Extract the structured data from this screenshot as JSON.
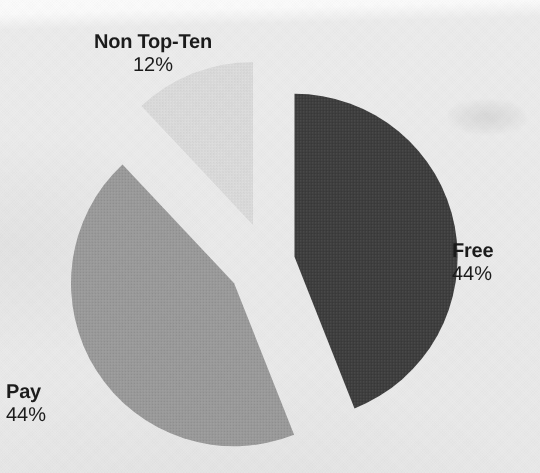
{
  "figure": {
    "kind": "pie-chart",
    "background_color": "#eaeaea",
    "medium": "scanned-print"
  },
  "chart_data": {
    "type": "pie",
    "title": "",
    "subtitle": "",
    "xlabel": "",
    "ylabel": "",
    "legend_position": "none",
    "grid": false,
    "exploded": true,
    "labels_show_percent": true,
    "total_percent": 100,
    "categories": [
      "Free",
      "Pay",
      "Non Top-Ten"
    ],
    "values": [
      44,
      44,
      12
    ],
    "value_labels": [
      "44%",
      "44%",
      "12%"
    ],
    "colors": [
      "#3d3d3d",
      "#9a9a9a",
      "#dcdcdc"
    ],
    "slices": [
      {
        "name": "Free",
        "value": 44,
        "value_label": "44%",
        "color": "#3d3d3d",
        "start_angle_deg": 0,
        "end_angle_deg": 158.4,
        "explode_direction_deg": 79,
        "label_position": "right"
      },
      {
        "name": "Pay",
        "value": 44,
        "value_label": "44%",
        "color": "#9a9a9a",
        "start_angle_deg": 158.4,
        "end_angle_deg": 316.8,
        "explode_direction_deg": 238,
        "label_position": "bottom-left"
      },
      {
        "name": "Non Top-Ten",
        "value": 12,
        "value_label": "12%",
        "color": "#dcdcdc",
        "start_angle_deg": 316.8,
        "end_angle_deg": 360,
        "explode_direction_deg": 338,
        "label_position": "top-left"
      }
    ]
  },
  "labels": {
    "non_top_ten": {
      "name": "Non Top-Ten",
      "percent": "12%"
    },
    "free": {
      "name": "Free",
      "percent": "44%"
    },
    "pay": {
      "name": "Pay",
      "percent": "44%"
    }
  }
}
